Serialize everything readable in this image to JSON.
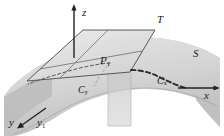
{
  "figure": {
    "kind": "3d-surface-tangent-plane-diagram",
    "background_color": "#ffffff",
    "ink_color": "#1a1a1a",
    "surface_fill": "#d2d2d2",
    "plane_fill": "#dcdcdc",
    "vertical_plane_fill": "#c9c9c9"
  },
  "labels": {
    "z_axis": "z",
    "x_axis": "x",
    "y_axis": "y",
    "y1_axis": "y",
    "y1_sub": "1",
    "tangent_plane": "T",
    "surface": "S",
    "point": "P",
    "point_sub": "1",
    "curve_x": "C",
    "curve_x_sub": "x",
    "curve_y": "C",
    "curve_y_sub": "y"
  }
}
